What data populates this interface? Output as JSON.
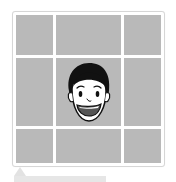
{
  "grid": {
    "rows": 3,
    "columns": 3,
    "cell_color": "#b9b9b9",
    "divider_color": "#ffffff",
    "center_cell": {
      "content": "cartoon-face-icon",
      "description": "smiling cartoon boy face with black hair"
    }
  },
  "colors": {
    "frame_border": "#d6d6d6",
    "cell": "#b9b9b9",
    "hair": "#111111",
    "skin": "#ffffff",
    "mouth": "#555555"
  },
  "slider": {
    "pointer_icon": "triangle-up-icon",
    "track_color": "#e6e6e6"
  }
}
